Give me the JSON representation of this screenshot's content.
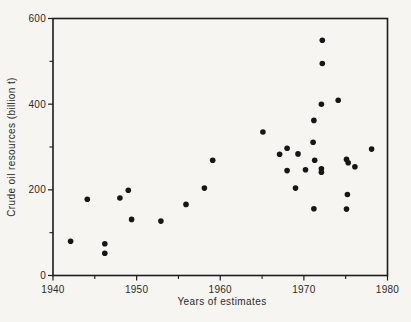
{
  "figure": {
    "background_color": "#f6f5f1",
    "axis_color": "#1c1c1c",
    "text_color": "#2a2a2a"
  },
  "chart_data": {
    "type": "scatter",
    "title": "",
    "xlabel": "Years of estimates",
    "ylabel": "Crude oil resources (billion t)",
    "xlim": [
      1940,
      1980
    ],
    "ylim": [
      0,
      600
    ],
    "x_major_ticks": [
      1940,
      1950,
      1960,
      1970,
      1980
    ],
    "x_minor_ticks": [
      1945,
      1955,
      1965,
      1975
    ],
    "y_major_ticks": [
      0,
      200,
      400,
      600
    ],
    "y_minor_ticks": [
      100,
      300,
      500
    ],
    "grid": false,
    "legend": false,
    "marker": {
      "shape": "circle",
      "color": "#161616",
      "radius_px": 2.8
    },
    "points": [
      {
        "x": 1942.1,
        "y": 80
      },
      {
        "x": 1944.1,
        "y": 178
      },
      {
        "x": 1946.2,
        "y": 74
      },
      {
        "x": 1946.2,
        "y": 52
      },
      {
        "x": 1948.0,
        "y": 181
      },
      {
        "x": 1949.0,
        "y": 199
      },
      {
        "x": 1949.4,
        "y": 131
      },
      {
        "x": 1952.9,
        "y": 127
      },
      {
        "x": 1955.9,
        "y": 166
      },
      {
        "x": 1958.1,
        "y": 204
      },
      {
        "x": 1959.1,
        "y": 269
      },
      {
        "x": 1965.1,
        "y": 335
      },
      {
        "x": 1967.1,
        "y": 283
      },
      {
        "x": 1968.0,
        "y": 297
      },
      {
        "x": 1968.0,
        "y": 245
      },
      {
        "x": 1969.0,
        "y": 204
      },
      {
        "x": 1969.3,
        "y": 284
      },
      {
        "x": 1970.2,
        "y": 247
      },
      {
        "x": 1971.1,
        "y": 311
      },
      {
        "x": 1971.2,
        "y": 362
      },
      {
        "x": 1971.2,
        "y": 156
      },
      {
        "x": 1971.3,
        "y": 269
      },
      {
        "x": 1972.1,
        "y": 400
      },
      {
        "x": 1972.1,
        "y": 249
      },
      {
        "x": 1972.1,
        "y": 241
      },
      {
        "x": 1972.2,
        "y": 549
      },
      {
        "x": 1972.2,
        "y": 495
      },
      {
        "x": 1974.1,
        "y": 409
      },
      {
        "x": 1975.1,
        "y": 271
      },
      {
        "x": 1975.1,
        "y": 155
      },
      {
        "x": 1975.2,
        "y": 189
      },
      {
        "x": 1975.3,
        "y": 263
      },
      {
        "x": 1976.1,
        "y": 254
      },
      {
        "x": 1978.1,
        "y": 295
      }
    ]
  }
}
